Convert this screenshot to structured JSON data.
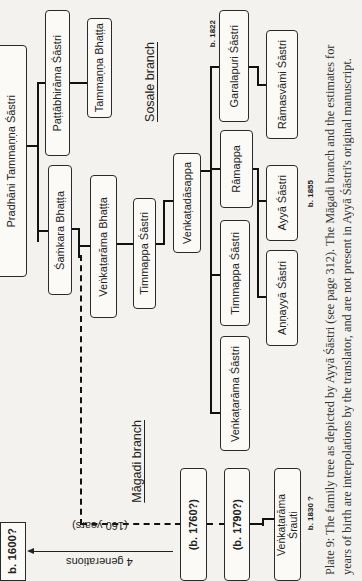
{
  "diagram": {
    "type": "family-tree",
    "orientation": "rotated-90-ccw",
    "branches": {
      "sosale": "Sosale branch",
      "magadi": "Māgadi branch"
    },
    "people": {
      "pradhani": "Pradhāni Tammaṇṇa Śāstri",
      "pattabhirama": "Paṭṭābhirāma Śāstri",
      "tammanna_bhatta": "Tammaṇṇa Bhaṭṭa",
      "samkara": "Śaṁkara Bhaṭṭa",
      "venkatarama_bhatta": "Veṅkaṭarāma Bhaṭṭa",
      "timmappa_1": "Timmappa Śāstri",
      "venkatadasappa": "Veṅkaṭadāsappa",
      "garalapuri": "Garalapuri Śāstri",
      "ramasvami": "Rāmasvāmi Śāstri",
      "ramappa": "Rāmappa",
      "ayya": "Ayyā Śāstri",
      "timmappa_2": "Timmappa Śāstri",
      "annayya": "Aṇṇayyā Śāstri",
      "venkatarama_sastri": "Veṅkaṭarāma Śāstri",
      "b1760": "(b. 1760?)",
      "b1790": "(b. 1790?)",
      "venkatarama_srauti_line1": "Veṅkaṭarāma",
      "venkatarama_srauti_line2": "Śrauti"
    },
    "dates": {
      "root": "b. 1600?",
      "garalapuri": "b. 1822",
      "ayya": "b. 1855",
      "srauti": "b. 1830 ?"
    },
    "gap_annotation": {
      "line1": "4 generations",
      "line2": "(160 years)"
    }
  },
  "caption": {
    "line1": "Plate 9: The family tree as depicted by Ayyā Śāstri (see page 312). The Māgadi branch and the estimates for",
    "line2": "years of birth are interpolations by the translator, and are not present in Ayyā Śāstri's original manuscript."
  }
}
